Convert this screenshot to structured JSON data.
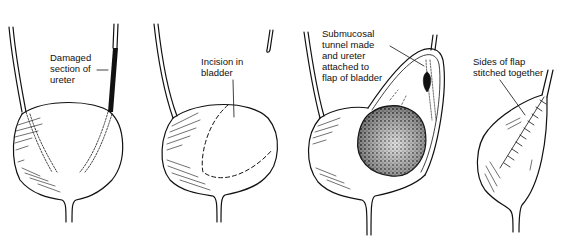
{
  "diagram": {
    "type": "surgical-illustration",
    "panels": [
      {
        "id": 1,
        "label": "Damaged\nsection of\nureter"
      },
      {
        "id": 2,
        "label": "Incision in\nbladder"
      },
      {
        "id": 3,
        "label": "Submucosal\ntunnel made\nand ureter\nattached to\nflap of bladder"
      },
      {
        "id": 4,
        "label": "Sides of flap\nstitched together"
      }
    ],
    "colors": {
      "ink": "#111111",
      "background": "#ffffff"
    }
  }
}
